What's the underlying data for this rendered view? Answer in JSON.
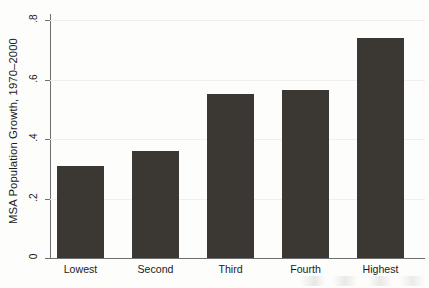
{
  "chart_data": {
    "type": "bar",
    "title": "",
    "subtitle": "",
    "xlabel": "",
    "ylabel": "MSA Population Growth, 1970–2000",
    "categories": [
      "Lowest",
      "Second",
      "Third",
      "Fourth",
      "Highest"
    ],
    "values": [
      0.31,
      0.36,
      0.55,
      0.565,
      0.74
    ],
    "series": [
      {
        "name": "MSA Population Growth, 1970–2000",
        "values": [
          0.31,
          0.36,
          0.55,
          0.565,
          0.74
        ]
      }
    ],
    "ylim": [
      0,
      0.8
    ],
    "yticks": [
      0,
      0.2,
      0.4,
      0.6,
      0.8
    ],
    "ytick_labels": [
      "0",
      ".2",
      ".4",
      ".6",
      ".8"
    ],
    "grid": true,
    "grid_axis": "y",
    "legend": false,
    "legend_position": "none",
    "bar_color": "#3b3733",
    "axis_color": "#6f6f6f",
    "grid_color": "#f0efee",
    "background_color": "#fdfdfc",
    "text_color": "#1b1b1b"
  }
}
